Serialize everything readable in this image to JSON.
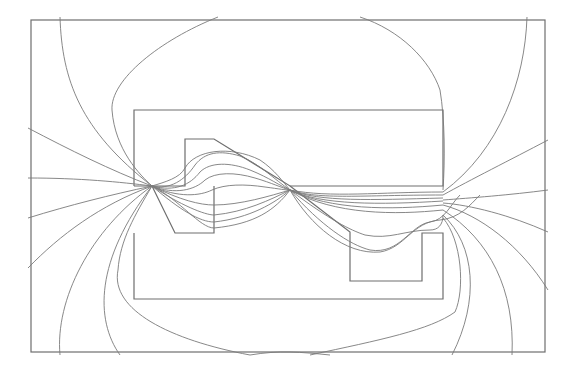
{
  "diagram": {
    "type": "magnetic field line plot",
    "colors": {
      "background": "#ffffff",
      "structure_stroke": "#6e6e6e",
      "field_stroke": "#7a7a7a"
    },
    "boundary": {
      "x": 31,
      "y": 20,
      "width": 514,
      "height": 332
    },
    "upper_core": {
      "outline": [
        [
          134,
          110
        ],
        [
          443,
          110
        ],
        [
          443,
          186
        ],
        [
          290,
          186
        ],
        [
          214,
          139
        ],
        [
          185,
          139
        ],
        [
          185,
          186
        ],
        [
          134,
          186
        ],
        [
          134,
          110
        ]
      ]
    },
    "lower_core": {
      "outline": [
        [
          134,
          299
        ],
        [
          443,
          299
        ],
        [
          443,
          233
        ],
        [
          422,
          233
        ],
        [
          422,
          281
        ],
        [
          350,
          281
        ],
        [
          350,
          232
        ],
        [
          214,
          232
        ],
        [
          214,
          186
        ],
        [
          290,
          186
        ]
      ],
      "left_pole": [
        [
          134,
          299
        ],
        [
          134,
          233
        ],
        [
          172,
          233
        ],
        [
          152,
          186
        ]
      ]
    },
    "gap_points": [
      {
        "name": "left-gap",
        "x": 152,
        "y": 186
      },
      {
        "name": "center-gap",
        "x": 290,
        "y": 190
      },
      {
        "name": "right-gap",
        "x": 443,
        "y": 195
      }
    ]
  }
}
